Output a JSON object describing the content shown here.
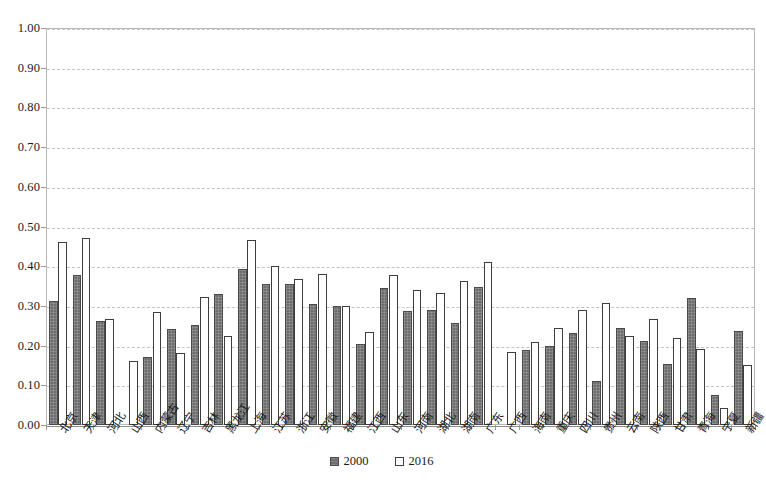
{
  "chart_data": {
    "type": "bar",
    "title": "",
    "xlabel": "",
    "ylabel": "",
    "ylim": [
      0.0,
      1.0
    ],
    "ytick_step": 0.1,
    "ytick_labels": [
      "1.00",
      "0.90",
      "0.80",
      "0.70",
      "0.60",
      "0.50",
      "0.40",
      "0.30",
      "0.20",
      "0.10",
      "0.00"
    ],
    "ytick_values": [
      1.0,
      0.9,
      0.8,
      0.7,
      0.6,
      0.5,
      0.4,
      0.3,
      0.2,
      0.1,
      0.0
    ],
    "grid": true,
    "legend_position": "bottom-center",
    "categories": [
      "北京",
      "天津",
      "河北",
      "山西",
      "内蒙古",
      "辽宁",
      "吉林",
      "黑龙江",
      "上海",
      "江苏",
      "浙江",
      "安徽",
      "福建",
      "江西",
      "山东",
      "河南",
      "湖北",
      "湖南",
      "广东",
      "广西",
      "海南",
      "重庆",
      "四川",
      "贵州",
      "云南",
      "陕西",
      "甘肃",
      "青海",
      "宁夏",
      "新疆"
    ],
    "series": [
      {
        "name": "2000",
        "color": "#6e6e6e",
        "values": [
          0.313,
          0.378,
          0.261,
          0.0,
          0.171,
          0.241,
          0.253,
          0.329,
          0.393,
          0.354,
          0.356,
          0.305,
          0.299,
          0.205,
          0.345,
          0.288,
          0.289,
          0.257,
          0.347,
          0.0,
          0.19,
          0.2,
          0.232,
          0.11,
          0.245,
          0.212,
          0.153,
          0.321,
          0.076,
          0.236
        ]
      },
      {
        "name": "2016",
        "color": "#ffffff",
        "values": [
          0.461,
          0.471,
          0.268,
          0.16,
          0.285,
          0.182,
          0.323,
          0.223,
          0.465,
          0.4,
          0.368,
          0.381,
          0.301,
          0.235,
          0.377,
          0.341,
          0.333,
          0.362,
          0.41,
          0.184,
          0.21,
          0.245,
          0.289,
          0.308,
          0.225,
          0.266,
          0.22,
          0.192,
          0.042,
          0.152
        ]
      }
    ]
  },
  "legend": {
    "items": [
      {
        "label": "2000",
        "style": "filled-gray"
      },
      {
        "label": "2016",
        "style": "hollow-white"
      }
    ]
  },
  "colors": {
    "series_2000": "#6e6e6e",
    "series_2016": "#ffffff",
    "bar_outline": "#3d3d3d",
    "gridline": "#c3c3c3",
    "axis": "#8d8d8d",
    "text": "#1a1a1a",
    "background": "#ffffff"
  }
}
